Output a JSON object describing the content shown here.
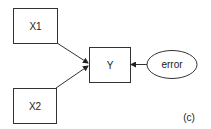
{
  "diagram": {
    "nodes": [
      {
        "id": "x1",
        "label": "X1",
        "shape": "rect"
      },
      {
        "id": "x2",
        "label": "X2",
        "shape": "rect"
      },
      {
        "id": "y",
        "label": "Y",
        "shape": "rect"
      },
      {
        "id": "error",
        "label": "error",
        "shape": "ellipse"
      }
    ],
    "edges": [
      {
        "from": "x1",
        "to": "y"
      },
      {
        "from": "x2",
        "to": "y"
      },
      {
        "from": "error",
        "to": "y"
      }
    ],
    "panel_label": "(c)",
    "colors": {
      "stroke": "#333333",
      "text": "#222222",
      "background": "#ffffff"
    }
  }
}
